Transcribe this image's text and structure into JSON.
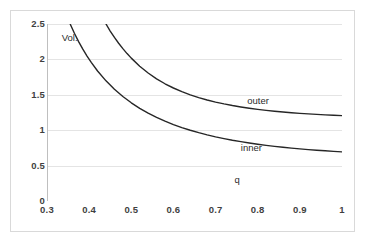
{
  "chart_data": {
    "type": "line",
    "title": "",
    "xlabel": "q",
    "ylabel": "Vol.",
    "xlim": [
      0.3,
      1.0
    ],
    "ylim": [
      0,
      2.5
    ],
    "grid": true,
    "legend_position": "inline-annotations",
    "x_ticks": [
      "0.3",
      "0.4",
      "0.5",
      "0.6",
      "0.7",
      "0.8",
      "0.9",
      "1"
    ],
    "x_tick_values": [
      0.3,
      0.4,
      0.5,
      0.6,
      0.7,
      0.8,
      0.9,
      1.0
    ],
    "y_ticks": [
      "0",
      "0.5",
      "1",
      "1.5",
      "2",
      "2.5"
    ],
    "y_tick_values": [
      0,
      0.5,
      1,
      1.5,
      2,
      2.5
    ],
    "series": [
      {
        "name": "outer",
        "color": "#262626",
        "label_x": 0.775,
        "label_y": 1.41,
        "x": [
          0.44,
          0.45,
          0.46,
          0.47,
          0.48,
          0.49,
          0.5,
          0.52,
          0.54,
          0.56,
          0.58,
          0.6,
          0.62,
          0.64,
          0.66,
          0.68,
          0.7,
          0.72,
          0.74,
          0.76,
          0.78,
          0.8,
          0.82,
          0.84,
          0.86,
          0.88,
          0.9,
          0.92,
          0.94,
          0.96,
          0.98,
          1.0
        ],
        "y": [
          2.5,
          2.4,
          2.31,
          2.228,
          2.152,
          2.082,
          2.018,
          1.904,
          1.808,
          1.726,
          1.656,
          1.596,
          1.544,
          1.5,
          1.461,
          1.427,
          1.397,
          1.371,
          1.348,
          1.328,
          1.31,
          1.294,
          1.28,
          1.268,
          1.257,
          1.247,
          1.238,
          1.23,
          1.223,
          1.217,
          1.211,
          1.206
        ]
      },
      {
        "name": "inner",
        "color": "#262626",
        "label_x": 0.76,
        "label_y": 0.755,
        "x": [
          0.355,
          0.365,
          0.375,
          0.385,
          0.395,
          0.405,
          0.42,
          0.44,
          0.46,
          0.48,
          0.5,
          0.52,
          0.54,
          0.56,
          0.58,
          0.6,
          0.62,
          0.64,
          0.66,
          0.68,
          0.7,
          0.72,
          0.74,
          0.76,
          0.78,
          0.8,
          0.82,
          0.84,
          0.86,
          0.88,
          0.9,
          0.92,
          0.94,
          0.96,
          0.98,
          1.0
        ],
        "y": [
          2.5,
          2.37,
          2.252,
          2.145,
          2.047,
          1.957,
          1.836,
          1.697,
          1.578,
          1.476,
          1.387,
          1.309,
          1.241,
          1.181,
          1.127,
          1.08,
          1.037,
          0.999,
          0.965,
          0.934,
          0.906,
          0.881,
          0.858,
          0.838,
          0.819,
          0.802,
          0.786,
          0.772,
          0.759,
          0.747,
          0.736,
          0.726,
          0.717,
          0.709,
          0.701,
          0.694
        ]
      }
    ],
    "annotations": [
      {
        "text": "q",
        "x": 0.745,
        "y": 0.3,
        "role": "x-axis-name"
      },
      {
        "text": "Vol.",
        "x": 0.335,
        "y": 2.3,
        "role": "y-axis-name"
      }
    ]
  }
}
